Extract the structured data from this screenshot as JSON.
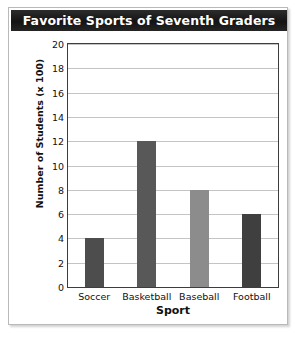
{
  "card": {
    "title": "Favorite Sports of Seventh Graders"
  },
  "chart_data": {
    "type": "bar",
    "title": "Favorite Sports of Seventh Graders",
    "xlabel": "Sport",
    "ylabel": "Number of Students (x 100)",
    "categories": [
      "Soccer",
      "Basketball",
      "Baseball",
      "Football"
    ],
    "values": [
      4,
      12,
      8,
      6
    ],
    "ylim": [
      0,
      20
    ],
    "ytick_step": 2,
    "yticks": [
      0,
      2,
      4,
      6,
      8,
      10,
      12,
      14,
      16,
      18,
      20
    ],
    "ytick_labels": [
      "0",
      "2",
      "4",
      "6",
      "8",
      "10",
      "12",
      "14",
      "16",
      "18",
      "20"
    ],
    "grid": true,
    "legend": false,
    "bar_colors": [
      "#4d4d4d",
      "#585858",
      "#8c8c8c",
      "#3f3f3f"
    ],
    "title_bar_color": "#1c1c1c",
    "title_text_color": "#ffffff",
    "gridline_color": "#c4c4c4",
    "frame_color": "#3d3d3d"
  }
}
